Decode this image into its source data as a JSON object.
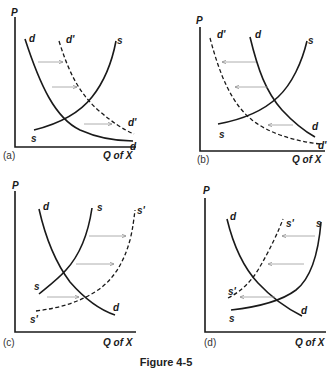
{
  "figure": {
    "caption": "Figure 4-5",
    "panels": [
      {
        "id": "a",
        "panel_label": "(a)",
        "y_axis_label": "P",
        "x_axis_label": "Q of X",
        "curves": {
          "demand": "d",
          "demand_end": "d",
          "demand_shifted": "d'",
          "demand_shifted_end": "d'",
          "supply": "s",
          "supply_end": "s"
        },
        "shift": "demand increases (rightward shift)"
      },
      {
        "id": "b",
        "panel_label": "(b)",
        "y_axis_label": "P",
        "x_axis_label": "Q of X",
        "curves": {
          "demand": "d",
          "demand_end": "d",
          "demand_shifted": "d'",
          "demand_shifted_end": "d'",
          "supply": "s",
          "supply_end": "s"
        },
        "shift": "demand decreases (leftward shift)"
      },
      {
        "id": "c",
        "panel_label": "(c)",
        "y_axis_label": "P",
        "x_axis_label": "Q of X",
        "curves": {
          "demand": "d",
          "demand_end": "d",
          "supply": "s",
          "supply_end": "s",
          "supply_shifted": "s'",
          "supply_shifted_end": "s'"
        },
        "shift": "supply increases (rightward shift)"
      },
      {
        "id": "d",
        "panel_label": "(d)",
        "y_axis_label": "P",
        "x_axis_label": "Q of X",
        "curves": {
          "demand": "d",
          "demand_end": "d",
          "supply": "s",
          "supply_end": "s",
          "supply_shifted": "s'",
          "supply_shifted_end": "s'"
        },
        "shift": "supply decreases (leftward shift)"
      }
    ]
  }
}
